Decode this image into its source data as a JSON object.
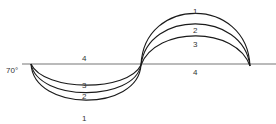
{
  "diagram": {
    "angle_label": "70°",
    "baseline_label_left": "4",
    "baseline_label_right": "4",
    "upper_curves": [
      {
        "label": "1"
      },
      {
        "label": "2"
      },
      {
        "label": "3"
      }
    ],
    "lower_curves": [
      {
        "label": "3"
      },
      {
        "label": "2"
      },
      {
        "label": "1"
      }
    ],
    "colors": {
      "curve": "#1a1a1a",
      "baseline": "#777777",
      "text": "#333333",
      "background": "#ffffff"
    }
  }
}
